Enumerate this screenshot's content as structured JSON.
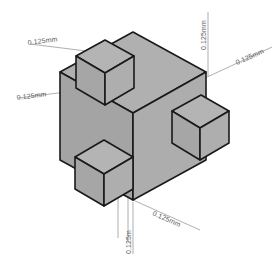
{
  "drawing": {
    "title": "Isometric cube with four cubic protrusions",
    "type": "isometric-technical-drawing",
    "background_color": "#ffffff",
    "face_fill_top": "#b0b0b0",
    "face_fill_left": "#a8a8a8",
    "face_fill_right": "#a9a9a9",
    "edge_color": "#1a1a1a",
    "leader_line_color": "#9a9a9a",
    "dimension_text_color": "#5a5a5a"
  },
  "solid": {
    "name": "main-cube",
    "protrusions": [
      {
        "id": "top-cube",
        "position": "top-face"
      },
      {
        "id": "right-cube",
        "position": "right-face"
      },
      {
        "id": "front-left-cube",
        "position": "left-face"
      }
    ]
  },
  "dimensions": [
    {
      "id": "dim-left-upper",
      "label": "0.125mm",
      "orientation": "diagonal-up-left"
    },
    {
      "id": "dim-left-lower",
      "label": "0.125mm",
      "orientation": "diagonal-up-left"
    },
    {
      "id": "dim-top-right-vertical",
      "label": "0.125mm",
      "orientation": "vertical"
    },
    {
      "id": "dim-top-right-diagonal",
      "label": "0.125mm",
      "orientation": "diagonal-up-right"
    },
    {
      "id": "dim-bottom-right-diagonal",
      "label": "0.125mm",
      "orientation": "diagonal-up-right"
    },
    {
      "id": "dim-bottom-vertical",
      "label": "0.125m",
      "orientation": "vertical"
    }
  ]
}
